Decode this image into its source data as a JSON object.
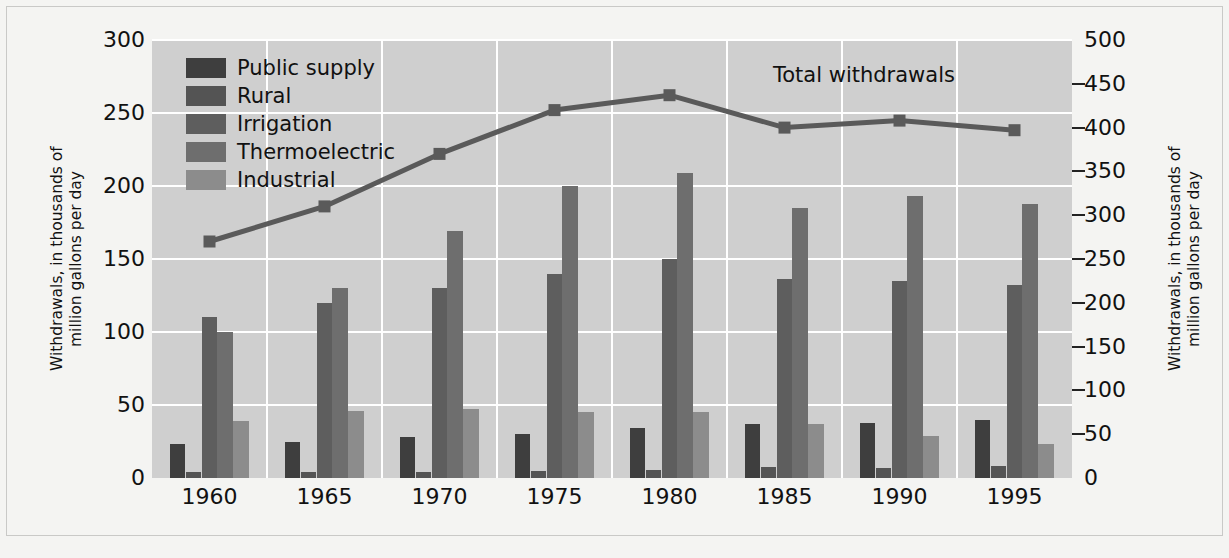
{
  "chart_data": {
    "type": "bar",
    "title": "",
    "categories": [
      "1960",
      "1965",
      "1970",
      "1975",
      "1980",
      "1985",
      "1990",
      "1995"
    ],
    "xlabel": "",
    "ylabel": "Withdrawals, in thousands of million gallons per day",
    "ylim": [
      0,
      300
    ],
    "yticks": [
      0,
      50,
      100,
      150,
      200,
      250,
      300
    ],
    "y2label": "Withdrawals, in thousands of million gallons per day",
    "y2lim": [
      0,
      500
    ],
    "y2ticks": [
      0,
      50,
      100,
      150,
      200,
      250,
      300,
      350,
      400,
      450,
      500
    ],
    "grid": true,
    "legend_position": "upper-left",
    "series": [
      {
        "name": "Public supply",
        "axis": "left",
        "color": "#3e3e3e",
        "values": [
          23,
          25,
          28,
          30,
          34,
          37,
          38,
          40
        ]
      },
      {
        "name": "Rural",
        "axis": "left",
        "color": "#545454",
        "values": [
          4,
          4,
          4,
          4.5,
          5.5,
          7.5,
          7,
          8
        ]
      },
      {
        "name": "Irrigation",
        "axis": "left",
        "color": "#5e5e5e",
        "values": [
          110,
          120,
          130,
          140,
          150,
          136,
          135,
          132
        ]
      },
      {
        "name": "Thermoelectric",
        "axis": "left",
        "color": "#6e6e6e",
        "values": [
          100,
          130,
          169,
          200,
          209,
          185,
          193,
          188
        ]
      },
      {
        "name": "Industrial",
        "axis": "left",
        "color": "#8c8c8c",
        "values": [
          39,
          46,
          47,
          45,
          45,
          37,
          29,
          23
        ]
      }
    ],
    "line_series": {
      "name": "Total withdrawals",
      "axis": "right",
      "color": "#5a5a5a",
      "values": [
        270,
        310,
        370,
        420,
        437,
        400,
        408,
        397
      ]
    },
    "annotations": [
      {
        "text": "Total withdrawals",
        "x": 1985,
        "y": 460
      }
    ],
    "colors": {
      "plot_background": "#cfcfcf",
      "figure_background": "#f4f4f2",
      "gridline": "#ffffff",
      "text": "#111111",
      "frame": "#c9c9c7"
    }
  },
  "legend": {
    "items": [
      {
        "label": "Public supply",
        "color": "#3e3e3e"
      },
      {
        "label": "Rural",
        "color": "#545454"
      },
      {
        "label": "Irrigation",
        "color": "#5e5e5e"
      },
      {
        "label": "Thermoelectric",
        "color": "#6e6e6e"
      },
      {
        "label": "Industrial",
        "color": "#8c8c8c"
      }
    ]
  },
  "axes": {
    "left_title": "Withdrawals, in thousands of\nmillion gallons per day",
    "right_title": "Withdrawals, in thousands of\nmillion gallons per day",
    "left_ticks": [
      "300",
      "250",
      "200",
      "150",
      "100",
      "50",
      "0"
    ],
    "right_ticks": [
      "500",
      "450",
      "400",
      "350",
      "300",
      "250",
      "200",
      "150",
      "100",
      "50",
      "0"
    ],
    "x_ticks": [
      "1960",
      "1965",
      "1970",
      "1975",
      "1980",
      "1985",
      "1990",
      "1995"
    ]
  },
  "annotation": {
    "total_withdrawals": "Total withdrawals"
  }
}
